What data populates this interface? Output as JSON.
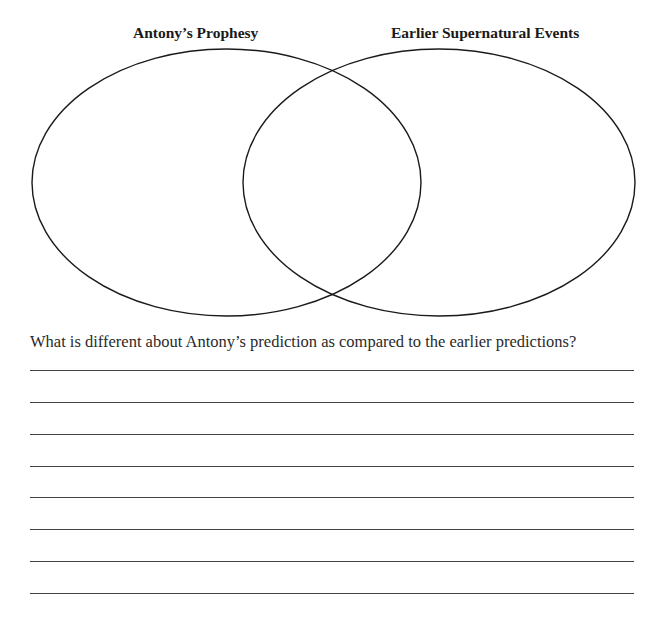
{
  "top_fragment": "",
  "venn": {
    "left_label": "Antony’s Prophesy",
    "right_label": "Earlier Supernatural Events",
    "left_ellipse": {
      "cx": 226.5,
      "cy": 182.5,
      "rx": 194.5,
      "ry": 133.5
    },
    "right_ellipse": {
      "cx": 439,
      "cy": 182.5,
      "rx": 196,
      "ry": 133.5
    }
  },
  "question": {
    "text": "What is different about Antony’s prediction as compared to the earlier predictions?",
    "answer_lines": [
      370,
      402,
      434,
      466,
      497,
      529,
      561,
      593
    ]
  }
}
